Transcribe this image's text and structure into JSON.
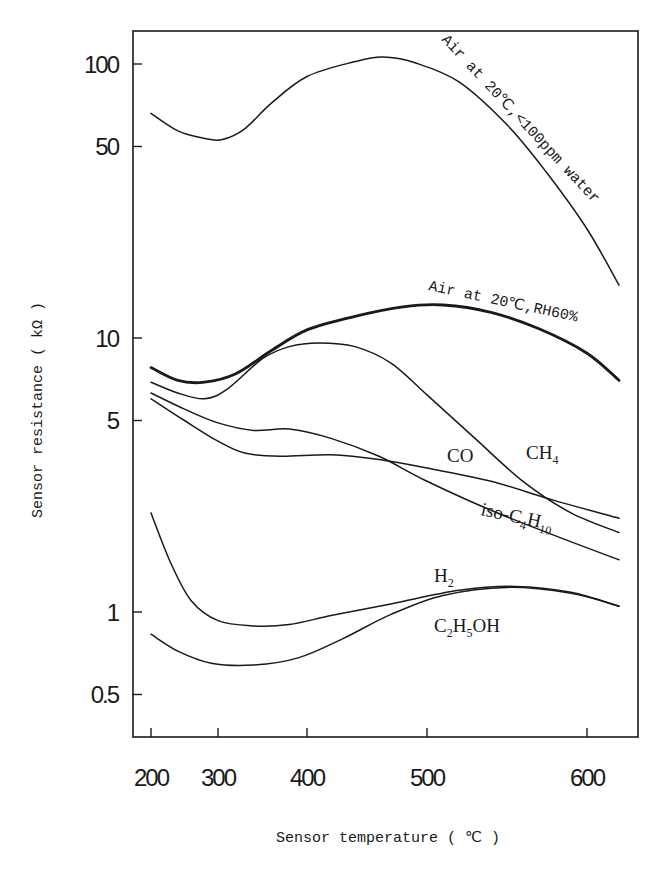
{
  "chart_data": {
    "type": "line",
    "title": "",
    "xlabel": "Sensor temperature ( ℃ )",
    "ylabel": "Sensor resistance ( kΩ )",
    "x_scale": "nonlinear (tick spacing increases with temperature)",
    "y_scale": "log",
    "xlim": [
      185,
      635
    ],
    "ylim": [
      0.4,
      130
    ],
    "x_ticks": [
      200,
      300,
      400,
      500,
      600
    ],
    "x_tick_labels": [
      "200",
      "300",
      "400",
      "500",
      "600"
    ],
    "y_ticks": [
      0.5,
      1,
      5,
      10,
      50,
      100
    ],
    "y_tick_labels": [
      "0.5",
      "1",
      "5",
      "10",
      "50",
      "100"
    ],
    "grid": false,
    "legend": "none (curves labeled inline)",
    "series": [
      {
        "name": "Air at 20℃, <100ppm water",
        "label": "Air at 20℃,<100ppm water",
        "bold": false,
        "points": [
          [
            200,
            66
          ],
          [
            240,
            57
          ],
          [
            280,
            53.5
          ],
          [
            305,
            53
          ],
          [
            330,
            58
          ],
          [
            360,
            72
          ],
          [
            400,
            90
          ],
          [
            440,
            102
          ],
          [
            463,
            106
          ],
          [
            490,
            101
          ],
          [
            520,
            86
          ],
          [
            550,
            60
          ],
          [
            575,
            40
          ],
          [
            600,
            25
          ],
          [
            620,
            15.6
          ]
        ]
      },
      {
        "name": "Air at 20℃, RH60%",
        "label": "Air at 20℃,RH60%",
        "bold": true,
        "points": [
          [
            200,
            7.8
          ],
          [
            240,
            7.0
          ],
          [
            280,
            6.9
          ],
          [
            320,
            7.4
          ],
          [
            360,
            9.0
          ],
          [
            400,
            10.7
          ],
          [
            440,
            12.0
          ],
          [
            480,
            13.0
          ],
          [
            510,
            13.2
          ],
          [
            540,
            12.4
          ],
          [
            570,
            10.8
          ],
          [
            600,
            8.8
          ],
          [
            620,
            7.0
          ]
        ]
      },
      {
        "name": "CH4",
        "label": "CH4",
        "bold": false,
        "points": [
          [
            200,
            6.9
          ],
          [
            240,
            6.3
          ],
          [
            280,
            6.0
          ],
          [
            310,
            6.5
          ],
          [
            350,
            8.4
          ],
          [
            380,
            9.3
          ],
          [
            410,
            9.6
          ],
          [
            440,
            9.3
          ],
          [
            470,
            8.1
          ],
          [
            500,
            6.2
          ],
          [
            530,
            4.3
          ],
          [
            560,
            3.0
          ],
          [
            590,
            2.3
          ],
          [
            620,
            1.95
          ]
        ]
      },
      {
        "name": "CO",
        "label": "CO",
        "bold": false,
        "points": [
          [
            200,
            6.0
          ],
          [
            250,
            5.0
          ],
          [
            300,
            4.2
          ],
          [
            330,
            3.8
          ],
          [
            370,
            3.7
          ],
          [
            420,
            3.75
          ],
          [
            460,
            3.6
          ],
          [
            500,
            3.35
          ],
          [
            540,
            3.0
          ],
          [
            580,
            2.55
          ],
          [
            620,
            2.2
          ]
        ]
      },
      {
        "name": "iso-C4H10",
        "label": "iso-C4H10",
        "bold": false,
        "points": [
          [
            200,
            6.3
          ],
          [
            250,
            5.5
          ],
          [
            300,
            4.9
          ],
          [
            340,
            4.6
          ],
          [
            380,
            4.65
          ],
          [
            420,
            4.3
          ],
          [
            460,
            3.7
          ],
          [
            500,
            3.0
          ],
          [
            540,
            2.35
          ],
          [
            580,
            1.9
          ],
          [
            620,
            1.55
          ]
        ]
      },
      {
        "name": "H2",
        "label": "H2",
        "bold": false,
        "points": [
          [
            200,
            2.3
          ],
          [
            230,
            1.5
          ],
          [
            260,
            1.1
          ],
          [
            300,
            0.93
          ],
          [
            340,
            0.89
          ],
          [
            380,
            0.9
          ],
          [
            420,
            0.97
          ],
          [
            470,
            1.07
          ],
          [
            520,
            1.2
          ],
          [
            555,
            1.24
          ],
          [
            590,
            1.18
          ],
          [
            620,
            1.05
          ]
        ]
      },
      {
        "name": "C2H5OH",
        "label": "C2H5OH",
        "bold": false,
        "points": [
          [
            200,
            0.83
          ],
          [
            240,
            0.72
          ],
          [
            290,
            0.65
          ],
          [
            340,
            0.64
          ],
          [
            390,
            0.68
          ],
          [
            430,
            0.8
          ],
          [
            470,
            0.98
          ],
          [
            510,
            1.15
          ],
          [
            550,
            1.23
          ],
          [
            590,
            1.17
          ],
          [
            620,
            1.05
          ]
        ]
      }
    ]
  }
}
